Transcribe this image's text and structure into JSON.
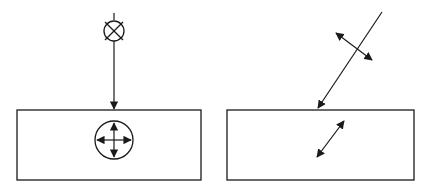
{
  "diagram": {
    "stroke_color": "#1a1a1a",
    "background": "#ffffff",
    "panels": [
      {
        "id": "left",
        "label": "unpolarized-light",
        "source_symbol": "beam-into-page-icon",
        "beam": "vertical",
        "medium_symbol": "four-way-arrows-in-circle"
      },
      {
        "id": "right",
        "label": "linearly-polarized-light",
        "beam": "oblique",
        "polarization_arrow_incident": "double-headed perpendicular to beam",
        "polarization_arrow_in_medium": "double-headed diagonal"
      }
    ]
  }
}
